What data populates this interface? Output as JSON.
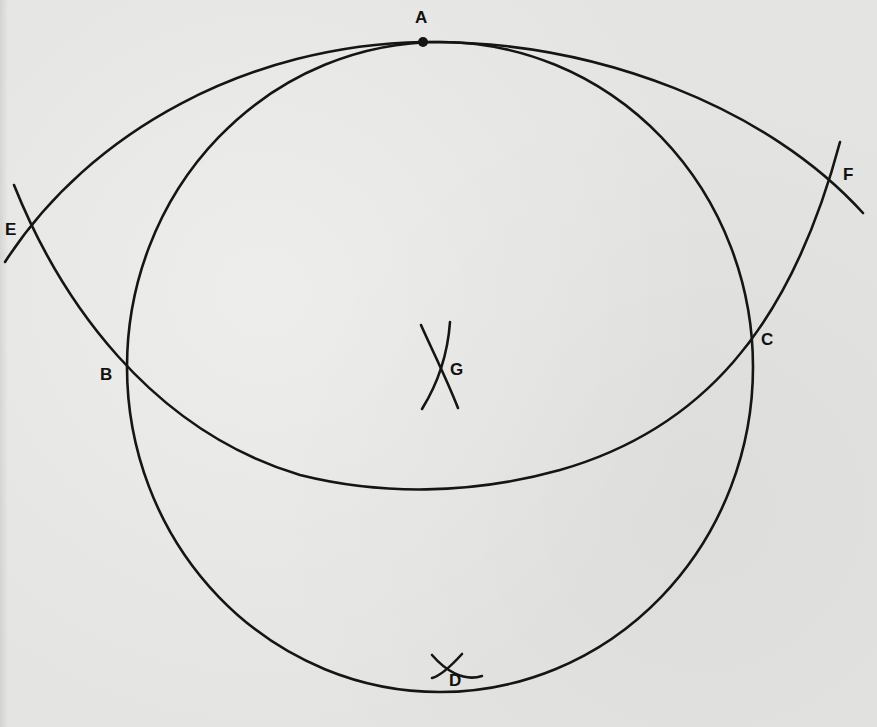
{
  "diagram": {
    "type": "compass-construction",
    "colors": {
      "background": "#e4e4e2",
      "stroke": "#151515",
      "label": "#111111"
    },
    "points": [
      {
        "id": "A",
        "label": "A",
        "x": 423,
        "y": 42
      },
      {
        "id": "B",
        "label": "B",
        "x": 130,
        "y": 372
      },
      {
        "id": "C",
        "label": "C",
        "x": 752,
        "y": 333
      },
      {
        "id": "D",
        "label": "D",
        "x": 440,
        "y": 670
      },
      {
        "id": "E",
        "label": "E",
        "x": 32,
        "y": 231
      },
      {
        "id": "F",
        "label": "F",
        "x": 830,
        "y": 183
      },
      {
        "id": "G",
        "label": "G",
        "x": 438,
        "y": 369
      }
    ],
    "labels": {
      "A": "A",
      "B": "B",
      "C": "C",
      "D": "D",
      "E": "E",
      "F": "F",
      "G": "G"
    },
    "shapes": {
      "main_circle": {
        "cx": 440,
        "cy": 367,
        "rx": 313,
        "ry": 325
      },
      "lower_arc": "centered at A, passing through E, B, C, F",
      "upper_arc": "passing through E, A, F"
    }
  }
}
